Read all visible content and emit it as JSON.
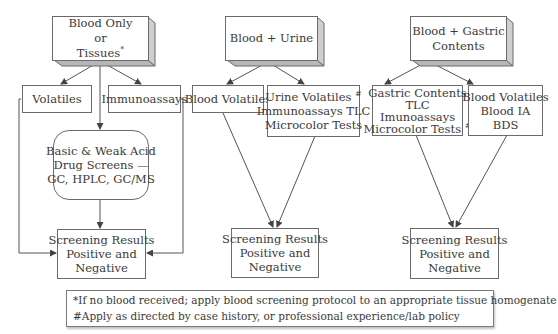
{
  "diagram": {
    "type": "flowchart",
    "colors": {
      "line": "#555555",
      "box_border": "#6b6b6b",
      "bevel_side": "#c8c8c8",
      "bevel_bottom": "#b0b0b0",
      "text": "#3a3a3a"
    },
    "columns": [
      {
        "id": "blood-only",
        "source": {
          "lines": [
            "Blood Only",
            "or",
            "Tissues"
          ],
          "mark": "*"
        },
        "branches": [
          {
            "id": "volatiles",
            "lines": [
              "Volatiles"
            ]
          },
          {
            "id": "immunoassays",
            "lines": [
              "Immunoassays"
            ]
          },
          {
            "id": "drug-screens",
            "lines": [
              "Basic & Weak Acid",
              "Drug Screens —",
              "GC, HPLC, GC/MS"
            ]
          }
        ],
        "result": {
          "lines": [
            "Screening Results",
            "Positive and",
            "Negative"
          ]
        }
      },
      {
        "id": "blood-urine",
        "source": {
          "lines": [
            "Blood + Urine"
          ]
        },
        "branches": [
          {
            "id": "blood-volatiles",
            "lines": [
              "Blood Volatiles"
            ]
          },
          {
            "id": "urine-tests",
            "lines": [
              "Urine Volatiles",
              "Immunoassays TLC",
              "Microcolor Tests"
            ],
            "mark": "#"
          }
        ],
        "result": {
          "lines": [
            "Screening Results",
            "Positive and",
            "Negative"
          ]
        }
      },
      {
        "id": "blood-gastric",
        "source": {
          "lines": [
            "Blood + Gastric",
            "Contents"
          ]
        },
        "branches": [
          {
            "id": "gastric-tests",
            "lines": [
              "Gastric Contents",
              "TLC",
              "Imunoassays",
              "Microcolor Tests"
            ],
            "mark": "#"
          },
          {
            "id": "blood-tests",
            "lines": [
              "Blood Volatiles",
              "Blood IA",
              "BDS"
            ]
          }
        ],
        "result": {
          "lines": [
            "Screening Results",
            "Positive and",
            "Negative"
          ]
        }
      }
    ],
    "legend": {
      "lines": [
        "*If no blood received; apply blood screening protocol to an appropriate tissue homogenate",
        "#Apply as directed by case history, or professional experience/lab policy"
      ]
    }
  }
}
